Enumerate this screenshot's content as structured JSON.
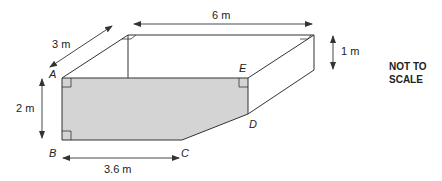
{
  "diagram": {
    "type": "prism-3d",
    "colors": {
      "face_fill": "#d4d4d4",
      "line": "#333333",
      "text": "#222222"
    },
    "points": {
      "A": "A",
      "B": "B",
      "C": "C",
      "D": "D",
      "E": "E"
    },
    "dimensions": {
      "length": "6 m",
      "depth": "3 m",
      "height_left": "2 m",
      "height_right": "1 m",
      "bottom_length": "3.6 m"
    },
    "note_line1": "NOT TO",
    "note_line2": "SCALE"
  }
}
